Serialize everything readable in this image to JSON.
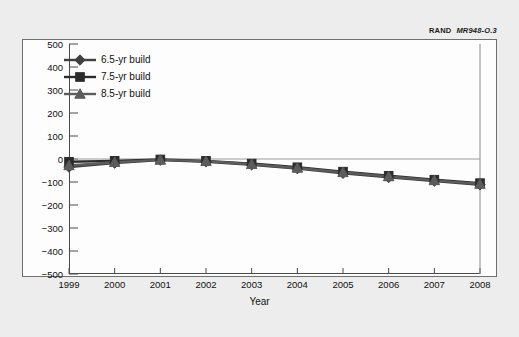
{
  "credit": {
    "org": "RAND",
    "code": "MR948-O.3"
  },
  "axis": {
    "ylabel": "Cost difference (FY98 $M)",
    "xlabel": "Year",
    "yticks": [
      500,
      400,
      300,
      200,
      100,
      0,
      -100,
      -200,
      -300,
      -400,
      -500
    ],
    "ytick_labels": [
      "500",
      "400",
      "300",
      "200",
      "100",
      "0",
      "−100",
      "−200",
      "−300",
      "−400",
      "−500"
    ],
    "xtick_labels": [
      "1999",
      "2000",
      "2001",
      "2002",
      "2003",
      "2004",
      "2005",
      "2006",
      "2007",
      "2008"
    ]
  },
  "legend": {
    "items": [
      {
        "label": "6.5-yr build",
        "marker": "diamond",
        "color": "#3f3f3f"
      },
      {
        "label": "7.5-yr build",
        "marker": "square",
        "color": "#2b2b2b"
      },
      {
        "label": "8.5-yr build",
        "marker": "triangle",
        "color": "#5c5c5c"
      }
    ]
  },
  "chart_data": {
    "type": "line",
    "title": "",
    "xlabel": "Year",
    "ylabel": "Cost difference (FY98 $M)",
    "categories": [
      "1999",
      "2000",
      "2001",
      "2002",
      "2003",
      "2004",
      "2005",
      "2006",
      "2007",
      "2008"
    ],
    "x": [
      1999,
      2000,
      2001,
      2002,
      2003,
      2004,
      2005,
      2006,
      2007,
      2008
    ],
    "ylim": [
      -500,
      500
    ],
    "xlim": [
      1999,
      2008
    ],
    "ytick_step": 100,
    "grid": false,
    "zero_line": true,
    "legend_position": "top-left",
    "series": [
      {
        "name": "6.5-yr build",
        "marker": "diamond",
        "color": "#3f3f3f",
        "values": [
          -35,
          -18,
          -5,
          -12,
          -25,
          -42,
          -62,
          -80,
          -96,
          -112
        ]
      },
      {
        "name": "7.5-yr build",
        "marker": "square",
        "color": "#2b2b2b",
        "values": [
          -12,
          -8,
          -2,
          -8,
          -20,
          -36,
          -55,
          -73,
          -90,
          -105
        ]
      },
      {
        "name": "8.5-yr build",
        "marker": "triangle",
        "color": "#5c5c5c",
        "values": [
          -28,
          -14,
          -4,
          -10,
          -23,
          -39,
          -58,
          -76,
          -93,
          -109
        ]
      }
    ]
  }
}
